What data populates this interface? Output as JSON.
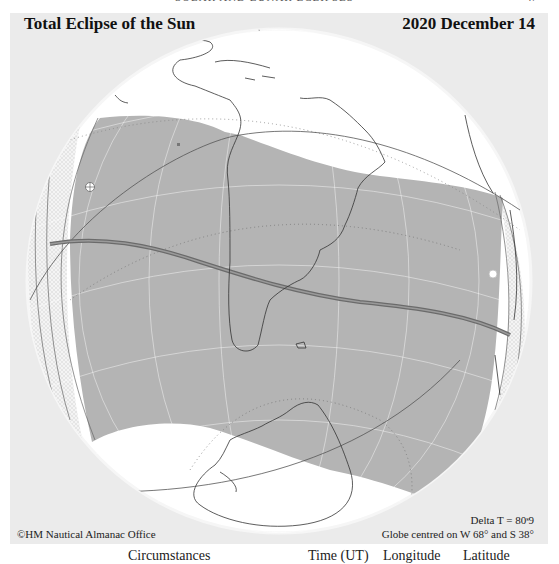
{
  "page": {
    "header_center": "SOLAR AND LUNAR ECLIPSES",
    "header_right": "47"
  },
  "figure": {
    "title": "Total Eclipse of the Sun",
    "date": "2020 December 14",
    "credit": "©HM Nautical Almanac Office",
    "delta_t": "Delta T = 80ˢ9",
    "globe_centre": "Globe centred on W 68° and S 38°",
    "colors": {
      "panel_bg": "#ebebeb",
      "globe_bg": "#ffffff",
      "eclipse_region": "#b4b4b4",
      "penumbra_edge_hatch": "#d8d8d8",
      "central_path": "#666666",
      "coastline": "#333333",
      "graticule": "#ffffff"
    },
    "projection": {
      "type": "orthographic",
      "centre_longitude": "W 68°",
      "centre_latitude": "S 38°"
    },
    "markers": [
      {
        "name": "start-marker",
        "symbol": "circle-cross"
      },
      {
        "name": "end-marker",
        "symbol": "open-circle"
      }
    ]
  },
  "table_header": {
    "circumstances": "Circumstances",
    "time": "Time (UT)",
    "longitude": "Longitude",
    "latitude": "Latitude"
  }
}
